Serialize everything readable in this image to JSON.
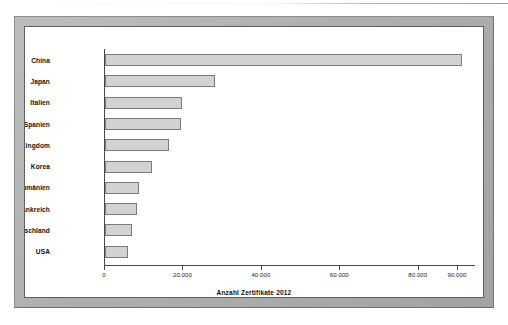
{
  "chart_data": {
    "type": "bar",
    "orientation": "horizontal",
    "title": "",
    "xlabel": "Anzahl Zertifikate 2012",
    "ylabel": "",
    "categories": [
      "China",
      "Japan",
      "Italien",
      "Spanien",
      "United Kingdom",
      "Korea",
      "Rumänien",
      "Frankreich",
      "Deutschland",
      "USA"
    ],
    "values": [
      91000,
      28000,
      19700,
      19500,
      16300,
      12000,
      8700,
      8200,
      6900,
      5800
    ],
    "xlim": [
      0,
      94600
    ],
    "xticks": [
      0,
      20000,
      40000,
      60000,
      80000,
      90000
    ],
    "xtick_labels": [
      "0",
      "20.000",
      "40.000",
      "60.000",
      "80.000",
      "90.000"
    ],
    "grid": false,
    "legend": false,
    "bar_fill_color": "#d2d2d2",
    "bar_border_color": "#7b7b7b",
    "axis_color": "#4a4a4a",
    "background_color": "#ffffff",
    "frame_color": "#b0b0b0"
  }
}
